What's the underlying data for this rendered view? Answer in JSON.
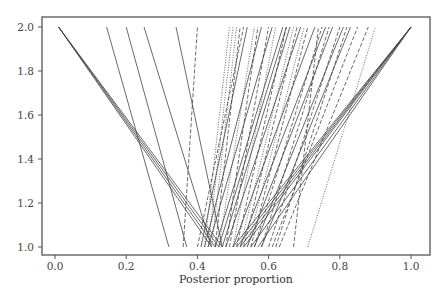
{
  "chart_data": {
    "type": "line",
    "title": "",
    "xlabel": "Posterior proportion",
    "ylabel": "",
    "xlim": [
      -0.04,
      1.05
    ],
    "ylim": [
      0.97,
      2.03
    ],
    "x_ticks": [
      "0.0",
      "0.2",
      "0.4",
      "0.6",
      "0.8",
      "1.0"
    ],
    "y_ticks": [
      "1.0",
      "1.2",
      "1.4",
      "1.6",
      "1.8",
      "2.0"
    ],
    "grid": false,
    "legend": null,
    "series": [
      {
        "style": "solid",
        "x": [
          0.44,
          0.01
        ],
        "y": [
          1.0,
          2.0
        ]
      },
      {
        "style": "solid",
        "x": [
          0.45,
          0.01
        ],
        "y": [
          1.0,
          2.0
        ]
      },
      {
        "style": "solid",
        "x": [
          0.46,
          0.01
        ],
        "y": [
          1.0,
          2.0
        ]
      },
      {
        "style": "solid",
        "x": [
          0.47,
          0.01
        ],
        "y": [
          1.0,
          2.0
        ]
      },
      {
        "style": "solid",
        "x": [
          0.32,
          0.145
        ],
        "y": [
          1.0,
          2.0
        ]
      },
      {
        "style": "solid",
        "x": [
          0.37,
          0.2
        ],
        "y": [
          1.0,
          2.0
        ]
      },
      {
        "style": "solid",
        "x": [
          0.44,
          0.25
        ],
        "y": [
          1.0,
          2.0
        ]
      },
      {
        "style": "solid",
        "x": [
          0.47,
          0.34
        ],
        "y": [
          1.0,
          2.0
        ]
      },
      {
        "style": "dashed",
        "x": [
          0.36,
          0.4
        ],
        "y": [
          1.0,
          2.0
        ]
      },
      {
        "style": "solid",
        "x": [
          0.5,
          1.0
        ],
        "y": [
          1.0,
          2.0
        ]
      },
      {
        "style": "solid",
        "x": [
          0.51,
          1.0
        ],
        "y": [
          1.0,
          2.0
        ]
      },
      {
        "style": "solid",
        "x": [
          0.52,
          1.0
        ],
        "y": [
          1.0,
          2.0
        ]
      },
      {
        "style": "solid",
        "x": [
          0.53,
          1.0
        ],
        "y": [
          1.0,
          2.0
        ]
      },
      {
        "style": "solid",
        "x": [
          0.55,
          1.0
        ],
        "y": [
          1.0,
          2.0
        ]
      },
      {
        "style": "solid",
        "x": [
          0.57,
          1.0
        ],
        "y": [
          1.0,
          2.0
        ]
      },
      {
        "style": "dotted",
        "x": [
          0.42,
          0.49
        ],
        "y": [
          1.0,
          2.0
        ]
      },
      {
        "style": "dotted",
        "x": [
          0.43,
          0.5
        ],
        "y": [
          1.0,
          2.0
        ]
      },
      {
        "style": "dotted",
        "x": [
          0.44,
          0.51
        ],
        "y": [
          1.0,
          2.0
        ]
      },
      {
        "style": "dashed",
        "x": [
          0.45,
          0.52
        ],
        "y": [
          1.0,
          2.0
        ]
      },
      {
        "style": "dashed",
        "x": [
          0.4,
          0.53
        ],
        "y": [
          1.0,
          2.0
        ]
      },
      {
        "style": "solid",
        "x": [
          0.41,
          0.54
        ],
        "y": [
          1.0,
          2.0
        ]
      },
      {
        "style": "dotted",
        "x": [
          0.46,
          0.56
        ],
        "y": [
          1.0,
          2.0
        ]
      },
      {
        "style": "dashed",
        "x": [
          0.48,
          0.57
        ],
        "y": [
          1.0,
          2.0
        ]
      },
      {
        "style": "solid",
        "x": [
          0.42,
          0.58
        ],
        "y": [
          1.0,
          2.0
        ]
      },
      {
        "style": "dashed",
        "x": [
          0.49,
          0.6
        ],
        "y": [
          1.0,
          2.0
        ]
      },
      {
        "style": "solid",
        "x": [
          0.43,
          0.61
        ],
        "y": [
          1.0,
          2.0
        ]
      },
      {
        "style": "dotted",
        "x": [
          0.5,
          0.62
        ],
        "y": [
          1.0,
          2.0
        ]
      },
      {
        "style": "solid",
        "x": [
          0.45,
          0.64
        ],
        "y": [
          1.0,
          2.0
        ]
      },
      {
        "style": "solid",
        "x": [
          0.46,
          0.65
        ],
        "y": [
          1.0,
          2.0
        ]
      },
      {
        "style": "dashed",
        "x": [
          0.51,
          0.65
        ],
        "y": [
          1.0,
          2.0
        ]
      },
      {
        "style": "solid",
        "x": [
          0.47,
          0.66
        ],
        "y": [
          1.0,
          2.0
        ]
      },
      {
        "style": "dotted",
        "x": [
          0.52,
          0.67
        ],
        "y": [
          1.0,
          2.0
        ]
      },
      {
        "style": "dashed",
        "x": [
          0.53,
          0.68
        ],
        "y": [
          1.0,
          2.0
        ]
      },
      {
        "style": "solid",
        "x": [
          0.48,
          0.69
        ],
        "y": [
          1.0,
          2.0
        ]
      },
      {
        "style": "dotted",
        "x": [
          0.54,
          0.7
        ],
        "y": [
          1.0,
          2.0
        ]
      },
      {
        "style": "dashed",
        "x": [
          0.55,
          0.71
        ],
        "y": [
          1.0,
          2.0
        ]
      },
      {
        "style": "solid",
        "x": [
          0.5,
          0.73
        ],
        "y": [
          1.0,
          2.0
        ]
      },
      {
        "style": "dashed",
        "x": [
          0.56,
          0.75
        ],
        "y": [
          1.0,
          2.0
        ]
      },
      {
        "style": "solid",
        "x": [
          0.52,
          0.76
        ],
        "y": [
          1.0,
          2.0
        ]
      },
      {
        "style": "dashed",
        "x": [
          0.58,
          0.77
        ],
        "y": [
          1.0,
          2.0
        ]
      },
      {
        "style": "solid",
        "x": [
          0.54,
          0.78
        ],
        "y": [
          1.0,
          2.0
        ]
      },
      {
        "style": "dashed",
        "x": [
          0.6,
          0.8
        ],
        "y": [
          1.0,
          2.0
        ]
      },
      {
        "style": "solid",
        "x": [
          0.56,
          0.81
        ],
        "y": [
          1.0,
          2.0
        ]
      },
      {
        "style": "dashed",
        "x": [
          0.62,
          0.82
        ],
        "y": [
          1.0,
          2.0
        ]
      },
      {
        "style": "solid",
        "x": [
          0.58,
          0.83
        ],
        "y": [
          1.0,
          2.0
        ]
      },
      {
        "style": "dashed",
        "x": [
          0.61,
          0.85
        ],
        "y": [
          1.0,
          2.0
        ]
      },
      {
        "style": "dashed",
        "x": [
          0.63,
          0.88
        ],
        "y": [
          1.0,
          2.0
        ]
      },
      {
        "style": "dashed",
        "x": [
          0.67,
          0.74
        ],
        "y": [
          1.0,
          2.0
        ]
      },
      {
        "style": "dotted",
        "x": [
          0.71,
          0.9
        ],
        "y": [
          1.0,
          2.0
        ]
      }
    ]
  },
  "axes": {
    "x_title": "Posterior proportion"
  }
}
